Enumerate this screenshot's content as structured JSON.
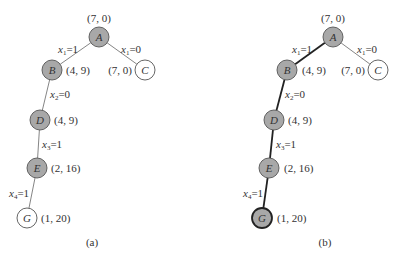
{
  "panels": [
    {
      "id": "a",
      "caption": "(a)",
      "caption_pos": [
        92,
        246
      ],
      "nodes": [
        {
          "id": "A",
          "x": 99,
          "y": 37,
          "filled": true,
          "bold": false,
          "value": "(7, 0)",
          "vx": 99,
          "vy": 22,
          "anchor": "middle"
        },
        {
          "id": "B",
          "x": 52,
          "y": 70,
          "filled": true,
          "bold": false,
          "value": "(4, 9)",
          "vx": 66,
          "vy": 74,
          "anchor": "start"
        },
        {
          "id": "C",
          "x": 145,
          "y": 70,
          "filled": false,
          "bold": false,
          "value": "(7, 0)",
          "vx": 132,
          "vy": 74,
          "anchor": "end"
        },
        {
          "id": "D",
          "x": 40,
          "y": 120,
          "filled": true,
          "bold": false,
          "value": "(4, 9)",
          "vx": 54,
          "vy": 124,
          "anchor": "start"
        },
        {
          "id": "E",
          "x": 37,
          "y": 168,
          "filled": true,
          "bold": false,
          "value": "(2, 16)",
          "vx": 51,
          "vy": 172,
          "anchor": "start"
        },
        {
          "id": "G",
          "x": 27,
          "y": 218,
          "filled": false,
          "bold": false,
          "value": "(1, 20)",
          "vx": 41,
          "vy": 222,
          "anchor": "start"
        }
      ],
      "edges": [
        {
          "from": "A",
          "to": "B",
          "var": "x",
          "sub": "1",
          "val": "=1",
          "lx": 58,
          "ly": 53,
          "bold": false
        },
        {
          "from": "A",
          "to": "C",
          "var": "x",
          "sub": "1",
          "val": "=0",
          "lx": 121,
          "ly": 53,
          "bold": false
        },
        {
          "from": "B",
          "to": "D",
          "var": "x",
          "sub": "2",
          "val": "=0",
          "lx": 50,
          "ly": 98,
          "bold": false
        },
        {
          "from": "D",
          "to": "E",
          "var": "x",
          "sub": "3",
          "val": "=1",
          "lx": 42,
          "ly": 148,
          "bold": false
        },
        {
          "from": "E",
          "to": "G",
          "var": "x",
          "sub": "4",
          "val": "=1",
          "lx": 9,
          "ly": 197,
          "bold": false
        }
      ]
    },
    {
      "id": "b",
      "caption": "(b)",
      "caption_pos": [
        325,
        246
      ],
      "nodes": [
        {
          "id": "A",
          "x": 333,
          "y": 37,
          "filled": true,
          "bold": false,
          "value": "(7, 0)",
          "vx": 333,
          "vy": 22,
          "anchor": "middle"
        },
        {
          "id": "B",
          "x": 287,
          "y": 70,
          "filled": true,
          "bold": false,
          "value": "(4, 9)",
          "vx": 302,
          "vy": 74,
          "anchor": "start"
        },
        {
          "id": "C",
          "x": 378,
          "y": 70,
          "filled": false,
          "bold": false,
          "value": "(7, 0)",
          "vx": 365,
          "vy": 74,
          "anchor": "end"
        },
        {
          "id": "D",
          "x": 274,
          "y": 120,
          "filled": true,
          "bold": false,
          "value": "(4, 9)",
          "vx": 288,
          "vy": 124,
          "anchor": "start"
        },
        {
          "id": "E",
          "x": 269,
          "y": 168,
          "filled": true,
          "bold": false,
          "value": "(2, 16)",
          "vx": 284,
          "vy": 172,
          "anchor": "start"
        },
        {
          "id": "G",
          "x": 262,
          "y": 218,
          "filled": true,
          "bold": true,
          "value": "(1, 20)",
          "vx": 277,
          "vy": 222,
          "anchor": "start"
        }
      ],
      "edges": [
        {
          "from": "A",
          "to": "B",
          "var": "x",
          "sub": "1",
          "val": "=1",
          "lx": 292,
          "ly": 53,
          "bold": true
        },
        {
          "from": "A",
          "to": "C",
          "var": "x",
          "sub": "1",
          "val": "=0",
          "lx": 357,
          "ly": 53,
          "bold": false
        },
        {
          "from": "B",
          "to": "D",
          "var": "x",
          "sub": "2",
          "val": "=0",
          "lx": 285,
          "ly": 98,
          "bold": true
        },
        {
          "from": "D",
          "to": "E",
          "var": "x",
          "sub": "3",
          "val": "=1",
          "lx": 276,
          "ly": 148,
          "bold": true
        },
        {
          "from": "E",
          "to": "G",
          "var": "x",
          "sub": "4",
          "val": "=1",
          "lx": 243,
          "ly": 197,
          "bold": true
        }
      ]
    }
  ],
  "style": {
    "node_fill": "#a8a8a8",
    "node_stroke": "#555555",
    "empty_fill": "#ffffff",
    "edge_color": "#777777",
    "bold_edge_color": "#222222",
    "node_radius": 10
  }
}
